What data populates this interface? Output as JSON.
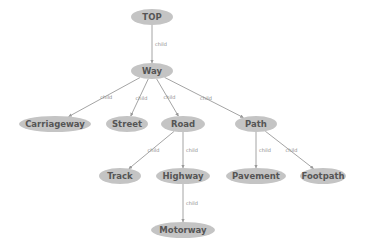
{
  "diagram": {
    "type": "tree",
    "colors": {
      "node_fill": "#c4c4c4",
      "node_text": "#555555",
      "edge": "#9a9a9a",
      "edge_label": "#8a8a8a",
      "background": "#ffffff"
    },
    "nodes": [
      {
        "id": "TOP",
        "label": "TOP",
        "cx": 152,
        "cy": 17,
        "rx": 21,
        "ry": 8
      },
      {
        "id": "Way",
        "label": "Way",
        "cx": 152,
        "cy": 71,
        "rx": 21,
        "ry": 8
      },
      {
        "id": "Carriageway",
        "label": "Carriageway",
        "cx": 55,
        "cy": 124,
        "rx": 36,
        "ry": 8
      },
      {
        "id": "Street",
        "label": "Street",
        "cx": 127,
        "cy": 124,
        "rx": 21,
        "ry": 8
      },
      {
        "id": "Road",
        "label": "Road",
        "cx": 183,
        "cy": 124,
        "rx": 22,
        "ry": 8
      },
      {
        "id": "Path",
        "label": "Path",
        "cx": 256,
        "cy": 124,
        "rx": 21,
        "ry": 8
      },
      {
        "id": "Track",
        "label": "Track",
        "cx": 120,
        "cy": 176,
        "rx": 21,
        "ry": 8
      },
      {
        "id": "Highway",
        "label": "Highway",
        "cx": 183,
        "cy": 176,
        "rx": 27,
        "ry": 8
      },
      {
        "id": "Pavement",
        "label": "Pavement",
        "cx": 256,
        "cy": 176,
        "rx": 30,
        "ry": 8
      },
      {
        "id": "Footpath",
        "label": "Footpath",
        "cx": 323,
        "cy": 176,
        "rx": 23,
        "ry": 8
      },
      {
        "id": "Motorway",
        "label": "Motorway",
        "cx": 183,
        "cy": 230,
        "rx": 32,
        "ry": 8
      }
    ],
    "edges": [
      {
        "from": "TOP",
        "to": "Way",
        "label": "child"
      },
      {
        "from": "Way",
        "to": "Carriageway",
        "label": "child"
      },
      {
        "from": "Way",
        "to": "Street",
        "label": "child"
      },
      {
        "from": "Way",
        "to": "Road",
        "label": "child"
      },
      {
        "from": "Way",
        "to": "Path",
        "label": "child"
      },
      {
        "from": "Road",
        "to": "Track",
        "label": "child"
      },
      {
        "from": "Road",
        "to": "Highway",
        "label": "child"
      },
      {
        "from": "Path",
        "to": "Pavement",
        "label": "child"
      },
      {
        "from": "Path",
        "to": "Footpath",
        "label": "child"
      },
      {
        "from": "Highway",
        "to": "Motorway",
        "label": "child"
      }
    ]
  }
}
